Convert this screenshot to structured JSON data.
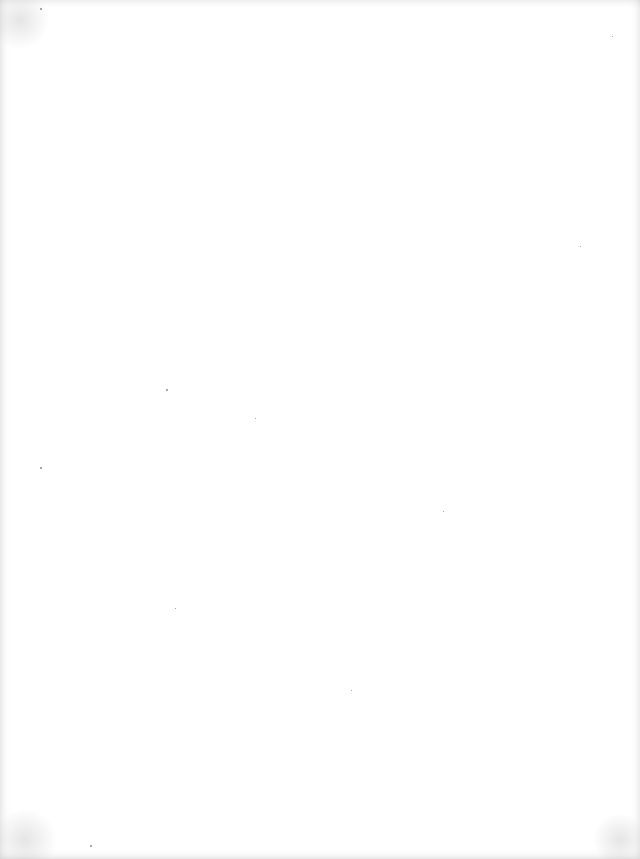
{
  "page": {
    "content": "",
    "background_color": "#ffffff",
    "specks": [
      {
        "x": 40,
        "y": 8,
        "size": 2
      },
      {
        "x": 166,
        "y": 389,
        "size": 2
      },
      {
        "x": 40,
        "y": 467,
        "size": 2
      },
      {
        "x": 580,
        "y": 246,
        "size": 1
      },
      {
        "x": 443,
        "y": 511,
        "size": 1
      },
      {
        "x": 351,
        "y": 690,
        "size": 1
      },
      {
        "x": 255,
        "y": 418,
        "size": 1
      },
      {
        "x": 90,
        "y": 845,
        "size": 2
      },
      {
        "x": 612,
        "y": 36,
        "size": 1
      },
      {
        "x": 175,
        "y": 608,
        "size": 1
      }
    ]
  }
}
